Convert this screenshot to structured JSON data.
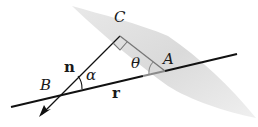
{
  "diagram": {
    "type": "geometry",
    "labels": {
      "C": "C",
      "A": "A",
      "B": "B",
      "n": "n",
      "r": "r",
      "alpha": "α",
      "theta": "θ"
    },
    "colors": {
      "line": "#111111",
      "plane": "#d9d9d9",
      "inside_plane_segment": "#7a7a7a"
    },
    "elements": [
      {
        "id": "plane",
        "kind": "shaded-quadrilateral"
      },
      {
        "id": "line-r",
        "kind": "line",
        "label": "r"
      },
      {
        "id": "normal-n",
        "kind": "arrow",
        "label": "n"
      },
      {
        "id": "segment-CA",
        "kind": "segment"
      },
      {
        "id": "right-angle-C",
        "kind": "right-angle-marker"
      },
      {
        "id": "angle-alpha",
        "kind": "angle-arc",
        "at": "B"
      },
      {
        "id": "angle-theta",
        "kind": "angle-arc",
        "at": "A"
      }
    ]
  }
}
